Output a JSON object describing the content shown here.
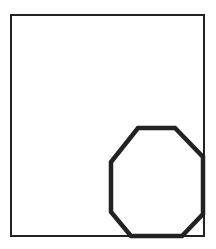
{
  "diagram": {
    "canvas": {
      "width": 216,
      "height": 249,
      "background": "#ffffff"
    },
    "rectangle": {
      "x1": 11,
      "y1": 15,
      "x2": 204,
      "y2": 236,
      "stroke": "#222222",
      "stroke_width": 2
    },
    "octagon": {
      "points": [
        [
          138,
          128
        ],
        [
          175,
          128
        ],
        [
          203,
          157
        ],
        [
          203,
          214
        ],
        [
          182,
          236
        ],
        [
          131,
          236
        ],
        [
          111,
          212
        ],
        [
          111,
          162
        ]
      ],
      "stroke": "#222222",
      "stroke_width": 4.5,
      "fill": "none"
    }
  }
}
